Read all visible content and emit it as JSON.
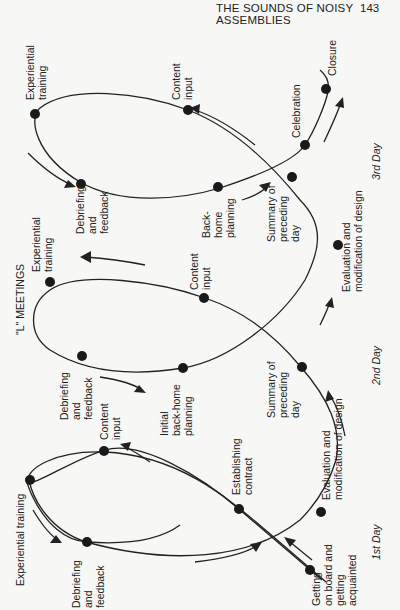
{
  "header": {
    "title": "THE SOUNDS OF NOISY ASSEMBLIES",
    "page_number": "143"
  },
  "diagram": {
    "caption": "\"L\" MEETINGS",
    "orientation": "rotated 90 degrees counter-clockwise",
    "days": [
      {
        "label": "1st Day",
        "stages": [
          {
            "lines": [
              "Getting",
              "on board and",
              "getting",
              "acquainted"
            ]
          },
          {
            "lines": [
              "Establishing",
              "contract"
            ]
          },
          {
            "lines": [
              "Content",
              "input"
            ]
          },
          {
            "lines": [
              "Experiential training"
            ]
          },
          {
            "lines": [
              "Debriefing",
              "and",
              "feedback"
            ]
          },
          {
            "lines": [
              "Initial",
              "back-home",
              "planning"
            ]
          }
        ]
      },
      {
        "label": "2nd Day",
        "stages": [
          {
            "lines": [
              "Evaluation and",
              "modification of design"
            ]
          },
          {
            "lines": [
              "Summary of",
              "preceding",
              "day"
            ]
          },
          {
            "lines": [
              "Content",
              "input"
            ]
          },
          {
            "lines": [
              "Experiential",
              "training"
            ]
          },
          {
            "lines": [
              "Debriefing",
              "and",
              "feedback"
            ]
          },
          {
            "lines": [
              "Back-",
              "home",
              "planning"
            ]
          }
        ]
      },
      {
        "label": "3rd Day",
        "stages": [
          {
            "lines": [
              "Evaluation and",
              "modification of design"
            ]
          },
          {
            "lines": [
              "Summary of",
              "preceding",
              "day"
            ]
          },
          {
            "lines": [
              "Content",
              "input"
            ]
          },
          {
            "lines": [
              "Experiential",
              "training"
            ]
          },
          {
            "lines": [
              "Debriefing",
              "and",
              "feedback"
            ]
          },
          {
            "lines": [
              "Celebration"
            ]
          },
          {
            "lines": [
              "Closure"
            ]
          }
        ]
      }
    ]
  }
}
